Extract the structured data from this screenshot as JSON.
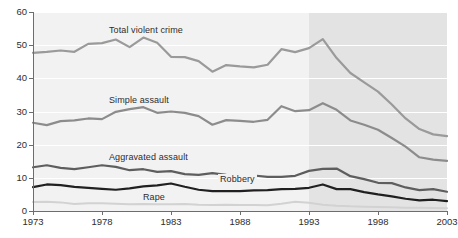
{
  "figure": {
    "top_fragment": "",
    "background": "#ffffff",
    "plot_background": "#f2f2f2",
    "shade_background": "#e3e3e3"
  },
  "axes": {
    "y_ticks": [
      "0",
      "10",
      "20",
      "30",
      "40",
      "50",
      "60"
    ],
    "x_ticks": [
      "1973",
      "1978",
      "1983",
      "1988",
      "1993",
      "1998",
      "2003"
    ]
  },
  "labels": {
    "total_violent_crime": "Total violent crime",
    "simple_assault": "Simple assault",
    "aggravated_assault": "Aggravated assault",
    "robbery": "Robbery",
    "rape": "Rape"
  },
  "chart_data": {
    "type": "line",
    "title": "",
    "xlabel": "",
    "ylabel": "",
    "xlim": [
      1973,
      2003
    ],
    "ylim": [
      0,
      60
    ],
    "grid": true,
    "legend": "inline-annotations",
    "shaded_region": {
      "from": 1993,
      "to": 2003,
      "color": "#e3e3e3"
    },
    "x": [
      1973,
      1974,
      1975,
      1976,
      1977,
      1978,
      1979,
      1980,
      1981,
      1982,
      1983,
      1984,
      1985,
      1986,
      1987,
      1988,
      1989,
      1990,
      1991,
      1992,
      1993,
      1994,
      1995,
      1996,
      1997,
      1998,
      1999,
      2000,
      2001,
      2002,
      2003
    ],
    "series": [
      {
        "name": "Total violent crime",
        "color": "#9a9a9a",
        "width": 2.2,
        "values": [
          47.7,
          48.0,
          48.4,
          48.0,
          50.4,
          50.6,
          51.7,
          49.4,
          52.3,
          50.7,
          46.5,
          46.4,
          45.2,
          42.0,
          44.0,
          43.6,
          43.3,
          44.1,
          48.8,
          47.9,
          49.1,
          51.8,
          46.1,
          41.6,
          38.8,
          36.0,
          32.1,
          27.9,
          24.7,
          23.1,
          22.6
        ]
      },
      {
        "name": "Simple assault",
        "color": "#8c8c8c",
        "width": 2.2,
        "values": [
          26.6,
          25.9,
          27.1,
          27.3,
          27.9,
          27.7,
          29.9,
          30.7,
          31.3,
          29.6,
          30.0,
          29.6,
          28.6,
          26.0,
          27.4,
          27.2,
          26.9,
          27.5,
          31.6,
          30.1,
          30.4,
          32.5,
          30.5,
          27.3,
          26.0,
          24.5,
          22.0,
          19.4,
          16.2,
          15.5,
          15.1
        ]
      },
      {
        "name": "Aggravated assault",
        "color": "#5e5e5e",
        "width": 2.2,
        "values": [
          13.2,
          13.8,
          13.0,
          12.6,
          13.2,
          13.8,
          13.3,
          12.3,
          12.6,
          11.8,
          12.0,
          11.1,
          10.9,
          11.4,
          10.9,
          10.8,
          10.7,
          10.3,
          10.3,
          10.6,
          12.1,
          12.7,
          12.8,
          10.5,
          9.6,
          8.5,
          8.4,
          7.1,
          6.3,
          6.6,
          5.8
        ]
      },
      {
        "name": "Robbery",
        "color": "#202020",
        "width": 2.2,
        "values": [
          7.2,
          8.0,
          7.8,
          7.3,
          7.0,
          6.7,
          6.4,
          6.8,
          7.4,
          7.7,
          8.3,
          7.3,
          6.4,
          6.0,
          6.0,
          6.0,
          6.2,
          6.3,
          6.6,
          6.7,
          7.0,
          8.0,
          6.6,
          6.6,
          5.7,
          5.0,
          4.4,
          3.7,
          3.2,
          3.4,
          3.0
        ]
      },
      {
        "name": "Rape",
        "color": "#d2d2d2",
        "width": 2.0,
        "values": [
          2.7,
          2.8,
          2.6,
          2.1,
          2.3,
          2.3,
          2.2,
          2.0,
          2.1,
          2.0,
          2.0,
          2.1,
          1.9,
          1.8,
          1.9,
          1.8,
          1.8,
          1.7,
          2.2,
          2.8,
          2.5,
          1.9,
          1.6,
          1.4,
          1.3,
          1.2,
          1.1,
          1.0,
          1.0,
          0.9,
          0.8
        ]
      }
    ]
  }
}
